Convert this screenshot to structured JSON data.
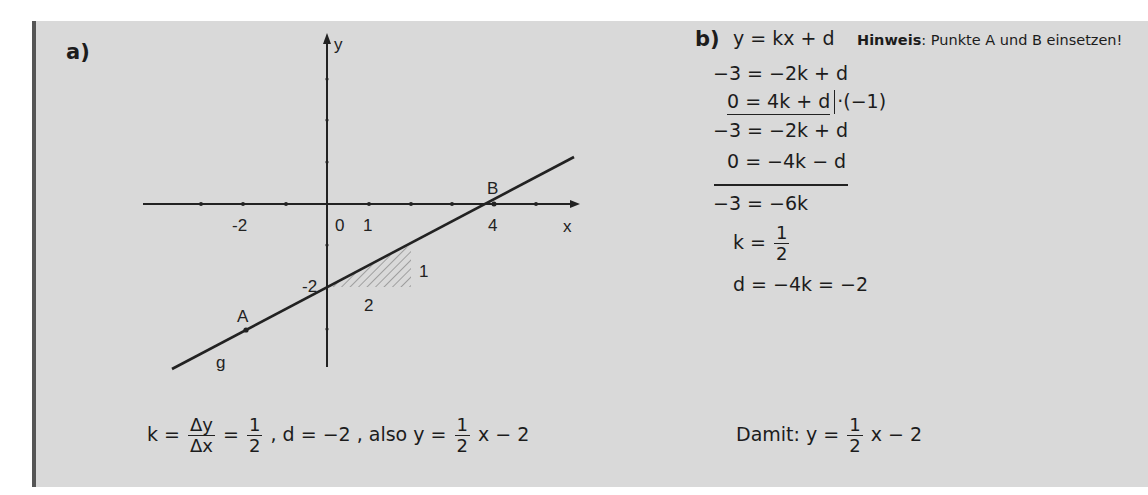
{
  "part_a": {
    "label": "a)",
    "graph": {
      "axis_x_label": "x",
      "axis_y_label": "y",
      "tick_labels": {
        "x_neg2": "-2",
        "origin": "0",
        "x_1": "1",
        "x_4": "4",
        "y_neg2": "-2"
      },
      "line_label": "g",
      "point_a_label": "A",
      "point_b_label": "B",
      "point_a": [
        -2,
        -3
      ],
      "point_b": [
        4,
        0
      ],
      "slope_triangle": {
        "run_label": "2",
        "rise_label": "1"
      }
    },
    "formula": {
      "k_lhs": "k =",
      "dy": "Δy",
      "dx": "Δx",
      "eq": "=",
      "one": "1",
      "two": "2",
      "d_part": ", d = −2 , also  y =",
      "one_b": "1",
      "two_b": "2",
      "tail": "x − 2"
    }
  },
  "part_b": {
    "label": "b)",
    "equation": "y = kx + d",
    "hint_bold": "Hinweis",
    "hint_text": ": Punkte A und B einsetzen!",
    "steps": {
      "s1": "−3 = −2k + d",
      "s2": "0 = 4k + d",
      "s2_op": "·(−1)",
      "s3": "−3 = −2k + d",
      "s4": "0 = −4k − d",
      "s5": "−3 = −6k",
      "s6_lhs": "k =",
      "s6_num": "1",
      "s6_den": "2",
      "s7": "d = −4k = −2"
    },
    "result": {
      "prefix": "Damit:  y =",
      "num": "1",
      "den": "2",
      "tail": "x − 2"
    }
  }
}
